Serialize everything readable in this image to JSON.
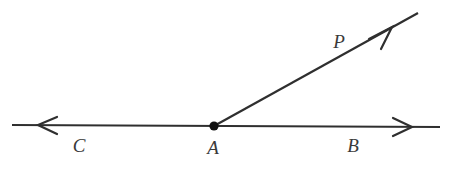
{
  "figure": {
    "kind": "geometry-diagram",
    "background_color": "#ffffff",
    "stroke_color": "#2f2f2f",
    "label_color": "#3a3a3a",
    "canvas": {
      "width": 450,
      "height": 173
    }
  },
  "labels": {
    "c": "C",
    "a": "A",
    "b": "B",
    "p": "P"
  },
  "label_positions": {
    "c": {
      "x": 79,
      "y": 145
    },
    "a": {
      "x": 213,
      "y": 147
    },
    "b": {
      "x": 353,
      "y": 145
    },
    "p": {
      "x": 339,
      "y": 41
    }
  },
  "geometry": {
    "line_cb": {
      "name": "line-cb",
      "x1": 12,
      "y1": 125,
      "x2": 440,
      "y2": 127,
      "stroke_width": 2.2,
      "arrow_left": {
        "tip_x": 38,
        "tip_y": 125,
        "length": 19,
        "spread": 9
      },
      "arrow_right": {
        "tip_x": 412,
        "tip_y": 127,
        "length": 19,
        "spread": 9
      }
    },
    "ray_ap": {
      "name": "ray-ap",
      "x1": 214,
      "y1": 126,
      "x2": 418,
      "y2": 13,
      "stroke_width": 2.2,
      "arrow": {
        "tip_x": 392,
        "tip_y": 27,
        "length": 22,
        "spread": 10
      }
    },
    "vertex_a": {
      "name": "vertex-point-a",
      "cx": 214,
      "cy": 126,
      "r": 4.6
    }
  }
}
